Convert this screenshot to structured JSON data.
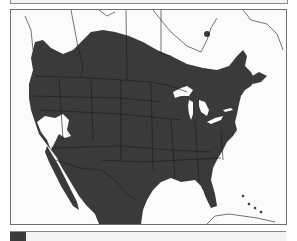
{
  "map": {
    "type": "range-map",
    "region": "North America",
    "colors": {
      "range_fill": "#3a3a3a",
      "background": "#fbfbfb",
      "border_lines": "#1a1a1a",
      "outline": "#6e6e6e",
      "water": "#ffffff"
    },
    "features": [
      "range-area",
      "great-lakes",
      "great-basin-gap",
      "gulf-of-mexico",
      "florida",
      "baja-california",
      "caribbean-islands",
      "hudson-bay",
      "atlantic-canada"
    ]
  },
  "legend": {
    "swatch_color": "#3a3a3a",
    "label": ""
  }
}
